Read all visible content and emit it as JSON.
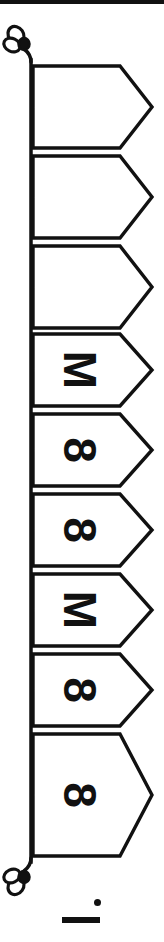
{
  "figure": {
    "orientation": "rotated-90-ccw",
    "stroke_color": "#111111",
    "fill_color": "#ffffff",
    "stroke_width": 3,
    "page_rule": {
      "name": "page-edge-rule",
      "color": "#111111",
      "x": 0,
      "y": 0,
      "width": 164,
      "height": 4
    },
    "rope": {
      "name": "banner-rope",
      "x": 30,
      "y_start": 62,
      "y_end": 860,
      "color": "#111111"
    },
    "knot_top": {
      "name": "rope-knot-top",
      "cx": 22,
      "cy": 42
    },
    "knot_bottom": {
      "name": "rope-knot-bottom",
      "cx": 22,
      "cy": 872
    },
    "banners": [
      {
        "index": 1,
        "label": "",
        "top": 66,
        "bottom": 148,
        "tip_x": 152
      },
      {
        "index": 2,
        "label": "",
        "top": 156,
        "bottom": 238,
        "tip_x": 152
      },
      {
        "index": 3,
        "label": "",
        "top": 246,
        "bottom": 328,
        "tip_x": 152
      },
      {
        "index": 4,
        "label": "M",
        "top": 334,
        "bottom": 406,
        "tip_x": 152
      },
      {
        "index": 5,
        "label": "8",
        "top": 414,
        "bottom": 486,
        "tip_x": 152
      },
      {
        "index": 6,
        "label": "8",
        "top": 494,
        "bottom": 566,
        "tip_x": 152
      },
      {
        "index": 7,
        "label": "M",
        "top": 574,
        "bottom": 646,
        "tip_x": 152
      },
      {
        "index": 8,
        "label": "8",
        "top": 654,
        "bottom": 726,
        "tip_x": 152
      },
      {
        "index": 9,
        "label": "8",
        "top": 734,
        "bottom": 856,
        "tip_x": 152
      }
    ],
    "caption": {
      "name": "figure-caption-mark",
      "text": "i",
      "stem": {
        "x": 62,
        "y": 917,
        "width": 38,
        "height": 6
      },
      "dot": {
        "x": 94,
        "y": 899,
        "diameter": 7
      }
    }
  }
}
